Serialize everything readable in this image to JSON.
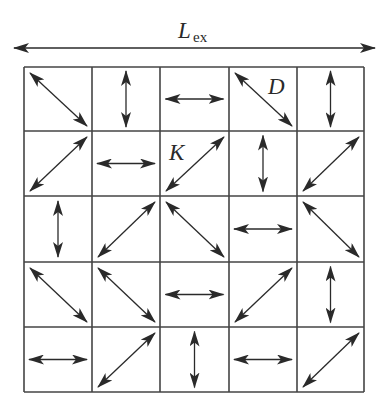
{
  "figure": {
    "title_main": "L",
    "title_sub": "ex",
    "span_arrow": {
      "x1": 14,
      "x2": 375,
      "y": 48,
      "direction": "double"
    },
    "colors": {
      "line": "#2a2a2a",
      "grid": "#444444",
      "background": "#ffffff"
    },
    "grid": {
      "rows": 5,
      "cols": 5,
      "x_lines": [
        24,
        92,
        160,
        229,
        297,
        364
      ],
      "y_lines": [
        67,
        131,
        196,
        262,
        327,
        392
      ],
      "cells": [
        [
          "diag-down",
          "vertical",
          "horizontal",
          "diag-down",
          "vertical"
        ],
        [
          "diag-up",
          "horizontal",
          "diag-up",
          "vertical",
          "diag-up"
        ],
        [
          "vertical",
          "diag-up",
          "diag-down",
          "horizontal",
          "diag-down"
        ],
        [
          "diag-down",
          "diag-down",
          "horizontal",
          "diag-up",
          "vertical"
        ],
        [
          "horizontal",
          "diag-up",
          "vertical",
          "horizontal",
          "diag-up"
        ]
      ]
    },
    "annotations": [
      {
        "text": "D",
        "row": 0,
        "col": 3,
        "x": 268,
        "y": 94
      },
      {
        "text": "K",
        "row": 1,
        "col": 2,
        "x": 169,
        "y": 160
      }
    ]
  }
}
